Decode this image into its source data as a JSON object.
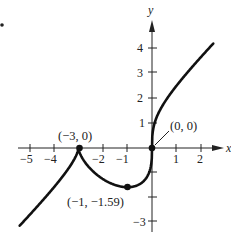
{
  "chart_data": {
    "type": "line",
    "title": "",
    "xlabel": "x",
    "ylabel": "y",
    "function": "f(x) = x^(1/3) (x + 3)^(2/3)",
    "xlim": [
      -5.4,
      2.8
    ],
    "ylim": [
      -3.2,
      5.0
    ],
    "grid": false,
    "x_ticks": [
      -5,
      -4,
      -3,
      -2,
      -1,
      1,
      2
    ],
    "x_tick_labels": [
      "−5",
      "−4",
      "",
      "−2",
      "−1",
      "1",
      "2"
    ],
    "y_ticks": [
      -3,
      -2,
      -1,
      1,
      2,
      3,
      4
    ],
    "y_tick_labels": [
      "−3",
      "",
      "",
      "1",
      "2",
      "3",
      "4"
    ],
    "series": [
      {
        "name": "f(x)",
        "x": [
          -5.4,
          -5,
          -4.5,
          -4,
          -3.5,
          -3,
          -2.8,
          -2.5,
          -2,
          -1.5,
          -1,
          -0.5,
          -0.2,
          -0.05,
          0,
          0.05,
          0.2,
          0.5,
          1,
          1.5,
          2,
          2.5
        ],
        "y": [
          -3.14,
          -2.71,
          -2.16,
          -1.59,
          -0.96,
          0,
          -0.46,
          -0.85,
          -1.26,
          -1.49,
          -1.59,
          -1.45,
          -1.12,
          -0.76,
          0,
          0.76,
          1.22,
          1.74,
          2.52,
          3.07,
          3.68,
          4.33
        ]
      }
    ],
    "points": [
      {
        "x": -3,
        "y": 0,
        "label": "(−3, 0)"
      },
      {
        "x": -1,
        "y": -1.59,
        "label": "(−1, −1.59)"
      },
      {
        "x": 0,
        "y": 0,
        "label": "(0, 0)"
      }
    ]
  },
  "labels": {
    "x_axis": "x",
    "y_axis": "y",
    "pt_neg3": "(−3, 0)",
    "pt_neg1": "(−1, −1.59)",
    "pt_origin": "(0, 0)",
    "xt_m5": "−5",
    "xt_m4": "−4",
    "xt_m2": "−2",
    "xt_m1": "−1",
    "xt_1": "1",
    "xt_2": "2",
    "yt_4": "4",
    "yt_3": "3",
    "yt_2": "2",
    "yt_1": "1",
    "yt_m3": "−3"
  }
}
